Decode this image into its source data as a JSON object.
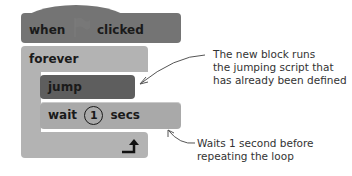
{
  "blocks": {
    "hat": {
      "when": "when",
      "icon": "green-flag-icon",
      "clicked": "clicked",
      "color": "#747474"
    },
    "forever": {
      "label": "forever",
      "color": "#b3b3b3",
      "loop_icon": "loop-arrow-icon"
    },
    "jump": {
      "label": "jump",
      "color": "#5e5e5e"
    },
    "wait": {
      "prefix": "wait",
      "value": "1",
      "suffix": "secs",
      "color": "#a9a9a9"
    }
  },
  "annotations": {
    "jump_note": {
      "line1": "The new block runs",
      "line2": "the jumping script that",
      "line3": "has already been defined"
    },
    "wait_note": {
      "line1": "Waits 1 second before",
      "line2": "repeating the loop"
    }
  }
}
